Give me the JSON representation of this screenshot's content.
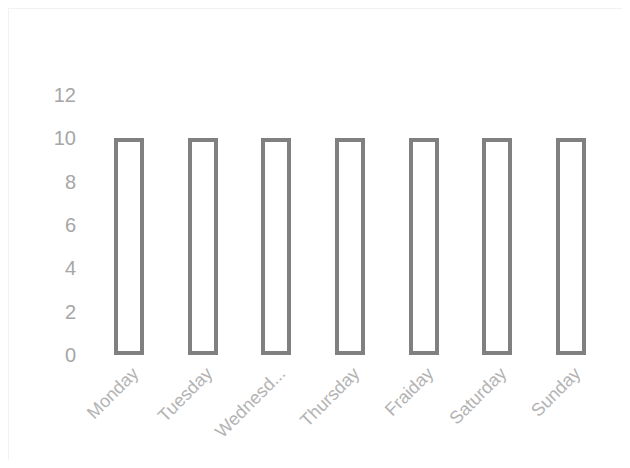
{
  "chart_data": {
    "type": "bar",
    "title": "",
    "subtitle": "",
    "xlabel": "",
    "ylabel": "",
    "categories": [
      "Monday",
      "Tuesday",
      "Wednesd...",
      "Thursday",
      "Fraiday",
      "Saturday",
      "Sunday"
    ],
    "values": [
      10,
      10,
      10,
      10,
      10,
      10,
      10
    ],
    "ylim": [
      0,
      12
    ],
    "yticks": [
      0,
      2,
      4,
      6,
      8,
      10,
      12
    ],
    "ytick_labels": [
      "0",
      "2",
      "4",
      "6",
      "8",
      "10",
      "12"
    ],
    "grid": false,
    "legend": false,
    "legend_position": "none",
    "series": [
      {
        "name": "",
        "values": [
          10,
          10,
          10,
          10,
          10,
          10,
          10
        ]
      }
    ],
    "annotations": [],
    "style": {
      "bar_fill": "none",
      "bar_border_color": "#808080",
      "bar_border_width_px": 4,
      "tick_label_color": "#a6a6a6",
      "category_label_color": "#b3b3b3",
      "category_label_rotation_deg": -45,
      "background": "#ffffff",
      "plot_border_color": "#f2f2f2"
    }
  }
}
